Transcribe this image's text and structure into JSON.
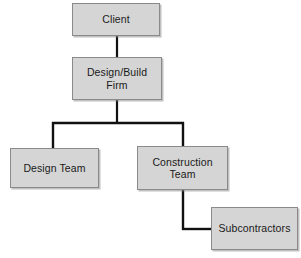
{
  "diagram": {
    "type": "organizational-hierarchy-chart",
    "background_color": "#ffffff",
    "node_fill_color": "#d5d5d5",
    "node_border_color": "#8a8a8a",
    "connector_color": "#111111",
    "nodes": [
      {
        "id": "client",
        "label": "Client",
        "level": 0
      },
      {
        "id": "design_build",
        "label": "Design/Build\nFirm",
        "level": 1
      },
      {
        "id": "design_team",
        "label": "Design Team",
        "level": 2
      },
      {
        "id": "construction",
        "label": "Construction\nTeam",
        "level": 2
      },
      {
        "id": "subcontractors",
        "label": "Subcontractors",
        "level": 3
      }
    ],
    "edges": [
      {
        "from": "client",
        "to": "design_build",
        "style": "straight-vertical"
      },
      {
        "from": "design_build",
        "to": "design_team",
        "style": "orthogonal-branch"
      },
      {
        "from": "design_build",
        "to": "construction",
        "style": "orthogonal-branch"
      },
      {
        "from": "construction",
        "to": "subcontractors",
        "style": "orthogonal-elbow"
      }
    ]
  }
}
